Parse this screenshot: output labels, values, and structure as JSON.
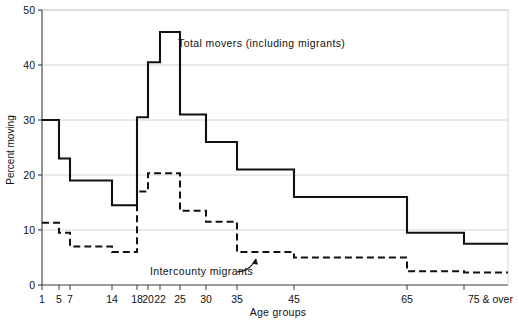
{
  "chart_data": {
    "type": "line",
    "title": "",
    "xlabel": "Age groups",
    "ylabel": "Percent moving",
    "xlim": [
      0,
      100
    ],
    "ylim": [
      0,
      50
    ],
    "grid": true,
    "grid_axis": "y",
    "legend": "inline-annotations",
    "x_tick_labels": [
      "1",
      "5",
      "7",
      "14",
      "18",
      "20",
      "22",
      "25",
      "30",
      "35",
      "45",
      "65",
      "75 & over"
    ],
    "x_tick_values": [
      1,
      5,
      7,
      14,
      18,
      20,
      22,
      25,
      30,
      35,
      45,
      65,
      75
    ],
    "y_tick_labels": [
      "0",
      "10",
      "20",
      "30",
      "40",
      "50"
    ],
    "y_tick_values": [
      0,
      10,
      20,
      30,
      40,
      50
    ],
    "series": [
      {
        "name": "Total movers (including migrants)",
        "style": "solid",
        "color": "#111111",
        "annotation": "Total movers (including migrants)",
        "step_bins": [
          {
            "from": 1,
            "to": 5,
            "value": 30.0
          },
          {
            "from": 5,
            "to": 7,
            "value": 23.0
          },
          {
            "from": 7,
            "to": 14,
            "value": 19.0
          },
          {
            "from": 14,
            "to": 18,
            "value": 14.5
          },
          {
            "from": 18,
            "to": 20,
            "value": 30.5
          },
          {
            "from": 20,
            "to": 22,
            "value": 40.5
          },
          {
            "from": 22,
            "to": 25,
            "value": 46.0
          },
          {
            "from": 25,
            "to": 30,
            "value": 31.0
          },
          {
            "from": 30,
            "to": 35,
            "value": 26.0
          },
          {
            "from": 35,
            "to": 45,
            "value": 21.0
          },
          {
            "from": 45,
            "to": 65,
            "value": 16.0
          },
          {
            "from": 65,
            "to": 75,
            "value": 9.5
          },
          {
            "from": 75,
            "to": 100,
            "value": 7.5
          }
        ]
      },
      {
        "name": "Intercounty migrants",
        "style": "dashed",
        "color": "#111111",
        "annotation": "Intercounty migrants",
        "step_bins": [
          {
            "from": 1,
            "to": 5,
            "value": 11.3
          },
          {
            "from": 5,
            "to": 7,
            "value": 9.5
          },
          {
            "from": 7,
            "to": 14,
            "value": 7.0
          },
          {
            "from": 14,
            "to": 18,
            "value": 6.0
          },
          {
            "from": 18,
            "to": 20,
            "value": 17.0
          },
          {
            "from": 20,
            "to": 22,
            "value": 20.3
          },
          {
            "from": 22,
            "to": 25,
            "value": 20.3
          },
          {
            "from": 25,
            "to": 30,
            "value": 13.5
          },
          {
            "from": 30,
            "to": 35,
            "value": 11.5
          },
          {
            "from": 35,
            "to": 45,
            "value": 6.0
          },
          {
            "from": 45,
            "to": 65,
            "value": 5.0
          },
          {
            "from": 65,
            "to": 75,
            "value": 2.5
          },
          {
            "from": 75,
            "to": 100,
            "value": 2.3
          }
        ]
      }
    ],
    "annotations": [
      {
        "text": "Total movers (including migrants)",
        "x_px": 178,
        "y_px": 47,
        "anchor": "start"
      },
      {
        "text": "Intercounty migrants",
        "x_px": 150,
        "y_px": 275,
        "anchor": "start"
      }
    ]
  },
  "axis": {
    "y_title": "Percent moving",
    "x_title": "Age groups",
    "last_tick_suffix": "& over"
  },
  "colors": {
    "line": "#111111",
    "grid": "#c9c9c9",
    "axis": "#3a3a3a",
    "background": "#ffffff",
    "text": "#111111"
  }
}
